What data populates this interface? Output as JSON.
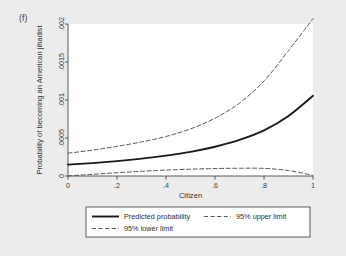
{
  "figure": {
    "panel_label": "(f)",
    "background_color": "#ececed",
    "plot_background_color": "#ffffff"
  },
  "chart_data": {
    "type": "line",
    "title": "",
    "subtitle": "",
    "xlabel": "Citizen",
    "ylabel": "Probability of becoming an American jihadist",
    "xlim": [
      0,
      1
    ],
    "ylim": [
      0,
      0.002
    ],
    "xticks": [
      0,
      0.2,
      0.4,
      0.6,
      0.8,
      1
    ],
    "xticklabels": [
      "0",
      ".2",
      ".4",
      ".6",
      ".8",
      "1"
    ],
    "yticks": [
      0,
      0.0005,
      0.001,
      0.0015,
      0.002
    ],
    "yticklabels": [
      "0",
      ".0005",
      ".001",
      ".0015",
      ".002"
    ],
    "grid": false,
    "legend_position": "below-plot",
    "line_color": "#1a1a1a",
    "series": [
      {
        "name": "Predicted probability",
        "style": "solid",
        "width": 1.9,
        "x": [
          0,
          0.1,
          0.2,
          0.3,
          0.4,
          0.5,
          0.6,
          0.7,
          0.8,
          0.9,
          1.0
        ],
        "values": [
          0.00015,
          0.00017,
          0.000196,
          0.000228,
          0.000268,
          0.000318,
          0.000385,
          0.000475,
          0.0006,
          0.00079,
          0.001055
        ]
      },
      {
        "name": "95% upper limit",
        "style": "dashed",
        "width": 1.0,
        "x": [
          0,
          0.1,
          0.2,
          0.3,
          0.4,
          0.5,
          0.6,
          0.7,
          0.8,
          0.9,
          1.0
        ],
        "values": [
          0.0003,
          0.00034,
          0.00039,
          0.000448,
          0.00052,
          0.00062,
          0.00076,
          0.00096,
          0.00125,
          0.00165,
          0.00207
        ]
      },
      {
        "name": "95% lower limit",
        "style": "dashed",
        "width": 1.0,
        "x": [
          0,
          0.1,
          0.2,
          0.3,
          0.4,
          0.5,
          0.6,
          0.7,
          0.8,
          0.9,
          1.0
        ],
        "values": [
          2e-06,
          2.2e-05,
          4.3e-05,
          6.2e-05,
          7.8e-05,
          9e-05,
          9.8e-05,
          0.000102,
          0.0001,
          7.2e-05,
          8e-06
        ]
      }
    ],
    "legend": [
      {
        "label": "Predicted probability",
        "style": "solid"
      },
      {
        "label": "95% upper limit",
        "style": "dashed"
      },
      {
        "label": "95% lower limit",
        "style": "dashed"
      }
    ]
  }
}
